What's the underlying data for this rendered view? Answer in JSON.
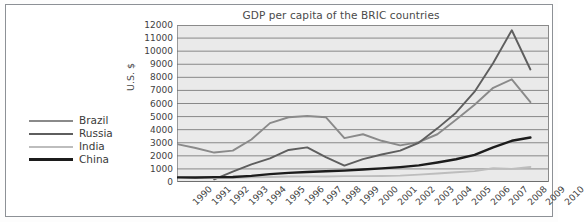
{
  "figure": {
    "background_color": "#ffffff",
    "plot_background_color": "#eaeaea"
  },
  "legend": {
    "position": "left-outside",
    "entries": [
      {
        "label": "Brazil",
        "color": "#8a8a8a",
        "width": 2.6
      },
      {
        "label": "Russia",
        "color": "#5e5e5e",
        "width": 2.6
      },
      {
        "label": "India",
        "color": "#bdbdbd",
        "width": 2.6
      },
      {
        "label": "China",
        "color": "#1c1c1c",
        "width": 3.0
      }
    ]
  },
  "chart_data": {
    "type": "line",
    "title": "GDP per capita of the BRIC countries",
    "xlabel": "",
    "ylabel": "U.S. $",
    "xlim": [
      1990,
      2010
    ],
    "ylim": [
      0,
      12000
    ],
    "grid": "horizontal",
    "legend_position": "left-outside",
    "x": [
      1990,
      1991,
      1992,
      1993,
      1994,
      1995,
      1996,
      1997,
      1998,
      1999,
      2000,
      2001,
      2002,
      2003,
      2004,
      2005,
      2006,
      2007,
      2008,
      2009
    ],
    "xticks": [
      1990,
      1991,
      1992,
      1993,
      1994,
      1995,
      1996,
      1997,
      1998,
      1999,
      2000,
      2001,
      2002,
      2003,
      2004,
      2005,
      2006,
      2007,
      2008,
      2009,
      2010
    ],
    "yticks": [
      0,
      1000,
      2000,
      3000,
      4000,
      5000,
      6000,
      7000,
      8000,
      9000,
      10000,
      11000,
      12000
    ],
    "series": [
      {
        "name": "Brazil",
        "color": "#8a8a8a",
        "values": [
          2900,
          2600,
          2250,
          2400,
          3250,
          4500,
          4950,
          5050,
          4950,
          3350,
          3650,
          3150,
          2800,
          3050,
          3650,
          4750,
          5900,
          7200,
          7850,
          6100
        ]
      },
      {
        "name": "Russia",
        "color": "#5e5e5e",
        "values": [
          null,
          null,
          200,
          800,
          1350,
          1800,
          2450,
          2650,
          1900,
          1250,
          1750,
          2100,
          2400,
          3000,
          4100,
          5300,
          6900,
          9100,
          11600,
          8600
        ]
      },
      {
        "name": "India",
        "color": "#bdbdbd",
        "values": [
          370,
          310,
          300,
          300,
          350,
          380,
          420,
          430,
          420,
          450,
          450,
          460,
          490,
          560,
          650,
          740,
          830,
          1050,
          1000,
          1150
        ]
      },
      {
        "name": "China",
        "color": "#1c1c1c",
        "values": [
          350,
          340,
          370,
          380,
          470,
          600,
          700,
          770,
          820,
          870,
          950,
          1040,
          1140,
          1270,
          1490,
          1740,
          2070,
          2650,
          3150,
          3400
        ]
      }
    ]
  }
}
